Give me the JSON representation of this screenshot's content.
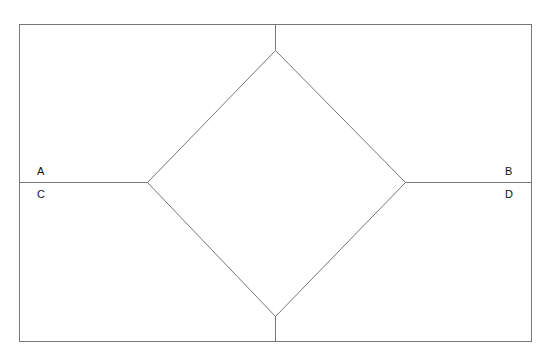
{
  "diagram": {
    "type": "rectangle-with-inscribed-diamond",
    "colors": {
      "line": "#777777",
      "background": "#ffffff",
      "text": "#111111"
    },
    "frame": {
      "x1": 19,
      "y1": 24,
      "x2": 531,
      "y2": 341
    },
    "diamond": {
      "top": [
        275,
        50
      ],
      "right": [
        405,
        182
      ],
      "bottom": [
        275,
        316
      ],
      "left": [
        147,
        182
      ]
    },
    "connectors": [
      {
        "name": "top-connector",
        "x1": 275,
        "y1": 24,
        "x2": 275,
        "y2": 50
      },
      {
        "name": "bottom-connector",
        "x1": 275,
        "y1": 316,
        "x2": 275,
        "y2": 341
      },
      {
        "name": "left-connector",
        "x1": 19,
        "y1": 182,
        "x2": 147,
        "y2": 182
      },
      {
        "name": "right-connector",
        "x1": 405,
        "y1": 182,
        "x2": 531,
        "y2": 182
      }
    ],
    "labels": [
      {
        "id": "A",
        "text": "A",
        "x": 37,
        "y": 166
      },
      {
        "id": "B",
        "text": "B",
        "x": 505,
        "y": 166
      },
      {
        "id": "C",
        "text": "C",
        "x": 37,
        "y": 189
      },
      {
        "id": "D",
        "text": "D",
        "x": 505,
        "y": 189
      }
    ]
  }
}
